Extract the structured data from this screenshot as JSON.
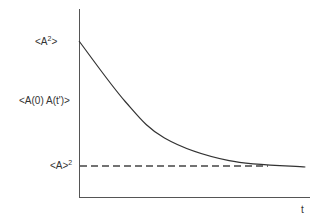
{
  "chart_data": {
    "type": "line",
    "title": "",
    "xlabel": "t",
    "ylabel": "<A(0) A(t')>",
    "y_markers": [
      {
        "id": "top",
        "label": "<A²>",
        "base": "<A",
        "sup": "2",
        "tail": ">"
      },
      {
        "id": "asymptote",
        "label": "<A>²",
        "base": "<A>",
        "sup": "2",
        "tail": ""
      }
    ],
    "series": [
      {
        "name": "autocorrelation",
        "style": "solid",
        "description": "exponential decay from <A²> toward <A>²"
      },
      {
        "name": "asymptote",
        "style": "dashed",
        "description": "horizontal line at <A>²"
      }
    ],
    "curve": {
      "start_value": 1.0,
      "asymptote_value": 0.0,
      "x_range": [
        0,
        1
      ],
      "points": [
        [
          0,
          1.0
        ],
        [
          0.2,
          0.52
        ],
        [
          0.37,
          0.23
        ],
        [
          0.65,
          0.05
        ],
        [
          0.98,
          0.0
        ]
      ]
    },
    "grid": false
  }
}
